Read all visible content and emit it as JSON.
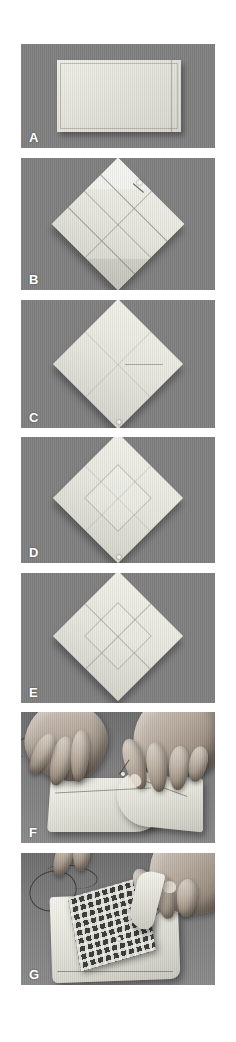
{
  "figure": {
    "name": "napkin-folding-step-sequence",
    "background_color": "#ffffff",
    "panel_background_color": "#808080",
    "label_color": "#ffffff",
    "width_px": 236,
    "height_px": 1042,
    "panels": [
      {
        "id": "A",
        "label": "A",
        "caption": "Flat rectangular folded cloth napkin laid on a grey surface",
        "subject": "rectangular-cloth",
        "top_px": 44,
        "height_px": 104
      },
      {
        "id": "B",
        "label": "B",
        "caption": "Cloth opened into a diamond with all four corners folded to the centre and pinned",
        "subject": "diamond-corners-folded-in",
        "top_px": 158,
        "height_px": 132
      },
      {
        "id": "C",
        "label": "C",
        "caption": "Diamond with a single horizontal crease visible across the middle",
        "subject": "diamond-creased",
        "top_px": 300,
        "height_px": 128
      },
      {
        "id": "D",
        "label": "D",
        "caption": "Diamond with upper corners turned down forming a smaller inner square",
        "subject": "diamond-inner-square",
        "top_px": 437,
        "height_px": 126
      },
      {
        "id": "E",
        "label": "E",
        "caption": "Finished flat diamond with crossed centre creases",
        "subject": "diamond-crossed-creases",
        "top_px": 573,
        "height_px": 130
      },
      {
        "id": "F",
        "label": "F",
        "caption": "Two hands stitching the folded corners together at the centre with needle and thread",
        "subject": "hands-stitching-centre",
        "top_px": 712,
        "height_px": 131
      },
      {
        "id": "G",
        "label": "G",
        "caption": "Hands placing a dark checked plaid patch onto the white folded napkin",
        "subject": "hands-placing-plaid-patch",
        "top_px": 853,
        "height_px": 132
      }
    ]
  }
}
